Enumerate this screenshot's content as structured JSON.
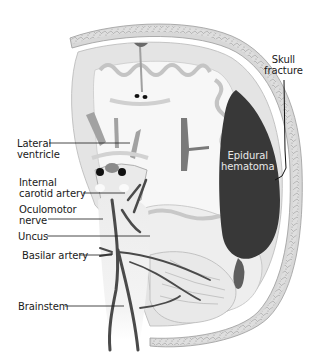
{
  "figure": {
    "colors": {
      "background": "#ffffff",
      "skull_outer": "#d9d9d9",
      "skull_diploe": "#cfcfcf",
      "brain_gray": "#e6e6e6",
      "brain_white": "#f7f7f7",
      "gyri_outline": "#c8c8c8",
      "hematoma": "#3a3a3a",
      "ventricle": "#9a9a9a",
      "artery": "#4a4a4a",
      "leader_line": "#1a1a1a"
    },
    "labels": {
      "skull_fracture": {
        "line1": "Skull",
        "line2": "fracture"
      },
      "lateral_ventricle": {
        "line1": "Lateral",
        "line2": "ventricle"
      },
      "epidural_hematoma": {
        "line1": "Epidural",
        "line2": "hematoma"
      },
      "internal_carotid_artery": {
        "line1": "Internal",
        "line2": "carotid artery"
      },
      "oculomotor_nerve": {
        "line1": "Oculomotor",
        "line2": "nerve"
      },
      "uncus": "Uncus",
      "basilar_artery": "Basilar artery",
      "brainstem": "Brainstem"
    }
  }
}
